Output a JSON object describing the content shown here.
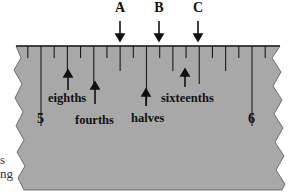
{
  "diagram": {
    "type": "ruler-closeup",
    "ruler_color": "#a9a9a9",
    "tick_color": "#1a1a1a",
    "top_markers": [
      {
        "label": "A",
        "x": 120
      },
      {
        "label": "B",
        "x": 159
      },
      {
        "label": "C",
        "x": 198
      }
    ],
    "whole_numbers": [
      {
        "label": "5",
        "x": 41
      },
      {
        "label": "6",
        "x": 252
      }
    ],
    "division_labels": {
      "eighths": "eighths",
      "fourths": "fourths",
      "halves": "halves",
      "sixteenths": "sixteenths"
    },
    "side_text_fragments": [
      "s",
      "ng"
    ]
  }
}
